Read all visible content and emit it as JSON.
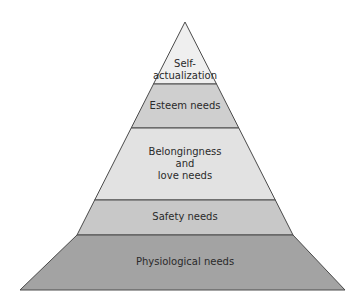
{
  "diagram": {
    "type": "pyramid",
    "title": "",
    "levels": [
      {
        "label_lines": [
          "Self-",
          "actualization"
        ],
        "label": "Self-actualization",
        "fill": "#efefef"
      },
      {
        "label_lines": [
          "Esteem needs"
        ],
        "label": "Esteem needs",
        "fill": "#cfcfcf"
      },
      {
        "label_lines": [
          "Belongingness",
          "and",
          "love needs"
        ],
        "label": "Belongingness and love needs",
        "fill": "#e2e2e2"
      },
      {
        "label_lines": [
          "Safety needs"
        ],
        "label": "Safety needs",
        "fill": "#c8c8c8"
      },
      {
        "label_lines": [
          "Physiological needs"
        ],
        "label": "Physiological needs",
        "fill": "#a3a3a3"
      }
    ],
    "outline_color": "#4a4a4a"
  }
}
